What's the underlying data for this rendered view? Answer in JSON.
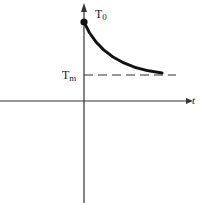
{
  "diagram": {
    "type": "exponential-decay-graph",
    "labels": {
      "initial": "T",
      "initial_sub": "0",
      "asymptote": "T",
      "asymptote_sub": "m",
      "x_axis": "t"
    },
    "colors": {
      "axis": "#333333",
      "curve": "#111111",
      "dashed": "#333333",
      "text": "#222222"
    }
  }
}
